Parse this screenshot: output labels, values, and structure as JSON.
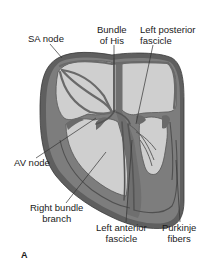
{
  "figure": {
    "panel_letter": "A"
  },
  "labels": {
    "sa_node": "SA node",
    "bundle_of_his": {
      "line1": "Bundle",
      "line2": "of His"
    },
    "left_posterior_fascicle": {
      "line1": "Left posterior",
      "line2": "fascicle"
    },
    "av_node": "AV node",
    "right_bundle_branch": {
      "line1": "Right bundle",
      "line2": "branch"
    },
    "left_anterior_fascicle": {
      "line1": "Left anterior",
      "line2": "fascicle"
    },
    "purkinje_fibers": {
      "line1": "Purkinje",
      "line2": "fibers"
    }
  },
  "colors": {
    "myocardium_outer": "#5a5a5a",
    "myocardium": "#7c7c7c",
    "chamber": "#cfcfcf",
    "conduction_path": "#6a6a6a",
    "leader_line": "#333333",
    "text": "#1a1a1a"
  }
}
